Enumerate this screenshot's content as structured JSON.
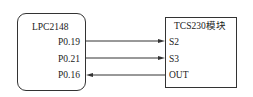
{
  "left_block": {
    "title": "LPC2148",
    "pins": [
      "P0.19",
      "P0.21",
      "P0.16"
    ]
  },
  "right_block": {
    "title": "TCS230模块",
    "pins": [
      "S2",
      "S3",
      "OUT"
    ]
  },
  "connections": [
    {
      "from": "P0.19",
      "to": "S2",
      "direction": "right"
    },
    {
      "from": "P0.21",
      "to": "S3",
      "direction": "right"
    },
    {
      "from": "OUT",
      "to": "P0.16",
      "direction": "left"
    }
  ],
  "colors": {
    "line": "#333333",
    "text": "#222222",
    "background": "#ffffff"
  }
}
